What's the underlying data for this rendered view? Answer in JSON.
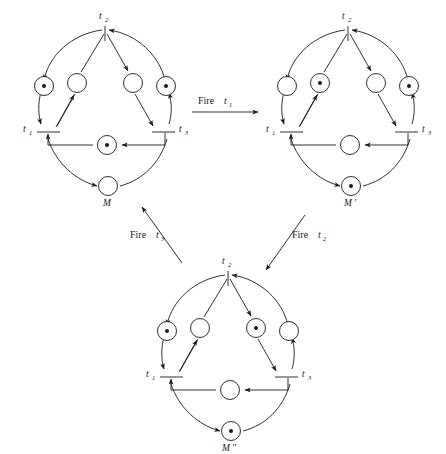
{
  "figure": {
    "background_color": "#ffffff",
    "ink_color": "#1a1a1a"
  },
  "transition_labels": {
    "t1": "t",
    "t1_sub": "1",
    "t2": "t",
    "t2_sub": "2",
    "t3": "t",
    "t3_sub": "3"
  },
  "nets": [
    {
      "id": "net-m",
      "marking_label": "M",
      "marking_label_prime": "",
      "center": {
        "x": 105,
        "y": 110
      },
      "places": [
        {
          "name": "outer-left",
          "tokens": 1
        },
        {
          "name": "inner-left",
          "tokens": 0
        },
        {
          "name": "inner-right",
          "tokens": 0
        },
        {
          "name": "outer-right",
          "tokens": 1
        },
        {
          "name": "center",
          "tokens": 1
        },
        {
          "name": "bottom",
          "tokens": 0
        }
      ],
      "transitions": [
        {
          "name": "t1",
          "label": "t",
          "sub": "1"
        },
        {
          "name": "t2",
          "label": "t",
          "sub": "2"
        },
        {
          "name": "t3",
          "label": "t",
          "sub": "3"
        }
      ]
    },
    {
      "id": "net-m-prime",
      "marking_label": "M",
      "marking_label_prime": "′",
      "center": {
        "x": 348,
        "y": 110
      },
      "places": [
        {
          "name": "outer-left",
          "tokens": 0
        },
        {
          "name": "inner-left",
          "tokens": 1
        },
        {
          "name": "inner-right",
          "tokens": 0
        },
        {
          "name": "outer-right",
          "tokens": 1
        },
        {
          "name": "center",
          "tokens": 0
        },
        {
          "name": "bottom",
          "tokens": 1
        }
      ],
      "transitions": [
        {
          "name": "t1",
          "label": "t",
          "sub": "1"
        },
        {
          "name": "t2",
          "label": "t",
          "sub": "2"
        },
        {
          "name": "t3",
          "label": "t",
          "sub": "3"
        }
      ]
    },
    {
      "id": "net-m-double-prime",
      "marking_label": "M",
      "marking_label_prime": "′′",
      "center": {
        "x": 228,
        "y": 355
      },
      "places": [
        {
          "name": "outer-left",
          "tokens": 1
        },
        {
          "name": "inner-left",
          "tokens": 0
        },
        {
          "name": "inner-right",
          "tokens": 1
        },
        {
          "name": "outer-right",
          "tokens": 0
        },
        {
          "name": "center",
          "tokens": 0
        },
        {
          "name": "bottom",
          "tokens": 1
        }
      ],
      "transitions": [
        {
          "name": "t1",
          "label": "t",
          "sub": "1"
        },
        {
          "name": "t2",
          "label": "t",
          "sub": "2"
        },
        {
          "name": "t3",
          "label": "t",
          "sub": "3"
        }
      ]
    }
  ],
  "flow_arrows": [
    {
      "id": "fire-t1",
      "word": "Fire",
      "var": "t",
      "sub": "1",
      "from": "net-m",
      "to": "net-m-prime",
      "direction": "right"
    },
    {
      "id": "fire-t2",
      "word": "Fire",
      "var": "t",
      "sub": "2",
      "from": "net-m-prime",
      "to": "net-m-double-prime",
      "direction": "down-left"
    },
    {
      "id": "fire-t3",
      "word": "Fire",
      "var": "t",
      "sub": "3",
      "from": "net-m-double-prime",
      "to": "net-m",
      "direction": "up-left"
    }
  ]
}
